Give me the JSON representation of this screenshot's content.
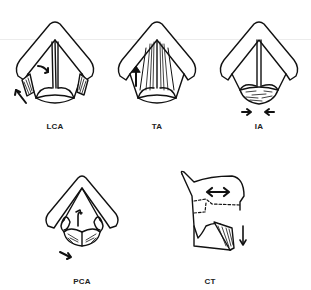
{
  "figure": {
    "panels": [
      {
        "id": "lca",
        "label": "LCA",
        "arrows": [
          "curved-arrow-inward",
          "arrow-up-left"
        ]
      },
      {
        "id": "ta",
        "label": "TA",
        "arrows": [
          "arrow-up"
        ]
      },
      {
        "id": "ia",
        "label": "IA",
        "arrows": [
          "arrow-right",
          "arrow-left"
        ]
      },
      {
        "id": "pca",
        "label": "PCA",
        "arrows": [
          "curved-arrow-up",
          "arrow-down-right"
        ]
      },
      {
        "id": "ct",
        "label": "CT",
        "arrows": [
          "double-arrow-horizontal",
          "arrow-down"
        ]
      }
    ]
  }
}
